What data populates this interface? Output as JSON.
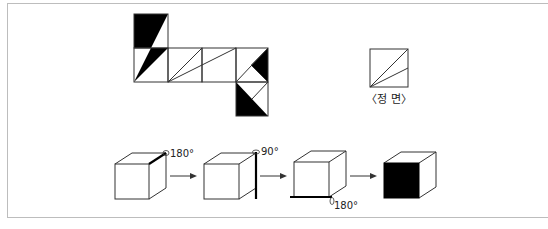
{
  "figure": {
    "front_view": {
      "label": "〈정 면〉"
    },
    "rotations": [
      {
        "step": 1,
        "label": "180°",
        "axis": "top-right edge"
      },
      {
        "step": 2,
        "label": "90°",
        "axis": "back-right vertical edge"
      },
      {
        "step": 3,
        "label": "180°",
        "axis": "bottom-front edge"
      }
    ],
    "net": {
      "squares": 7,
      "fill_color": "#000000",
      "line_color": "#333333"
    },
    "result": {
      "description": "cube with black front face"
    }
  }
}
